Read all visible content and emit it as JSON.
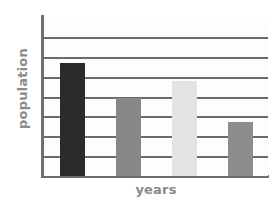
{
  "chart_data": {
    "type": "bar",
    "title": "",
    "subtitle": "",
    "xlabel": "years",
    "ylabel": "population",
    "categories": [
      "",
      "",
      "",
      ""
    ],
    "values": [
      5.7,
      3.9,
      4.8,
      2.7
    ],
    "series": [
      {
        "name": "population",
        "values": [
          5.7,
          3.9,
          4.8,
          2.7
        ]
      }
    ],
    "bar_colors": [
      "#2b2b2b",
      "#878787",
      "#e3e3e3",
      "#8d8d8d"
    ],
    "ylim": [
      0,
      8
    ],
    "xlim": [
      0,
      4
    ],
    "y_tick_values": [
      0,
      1,
      2,
      3,
      4,
      5,
      6,
      7,
      8
    ],
    "y_tick_labels": [
      "",
      "",
      "",
      "",
      "",
      "",
      "",
      "",
      ""
    ],
    "x_tick_labels": [
      "",
      "",
      "",
      ""
    ],
    "gridlines": {
      "horizontal": true,
      "vertical": false,
      "count": 7,
      "color": "#6b6b6b"
    },
    "legend": {
      "visible": false,
      "position": "none",
      "entries": []
    },
    "annotations": [],
    "axis_color": "#6f6f6f",
    "label_color": "#8a8a8a",
    "background_color": "#ffffff",
    "plot_background_color": "#fdfdfd"
  },
  "figure": {
    "ylabel_text": "population",
    "xlabel_text": "years"
  }
}
